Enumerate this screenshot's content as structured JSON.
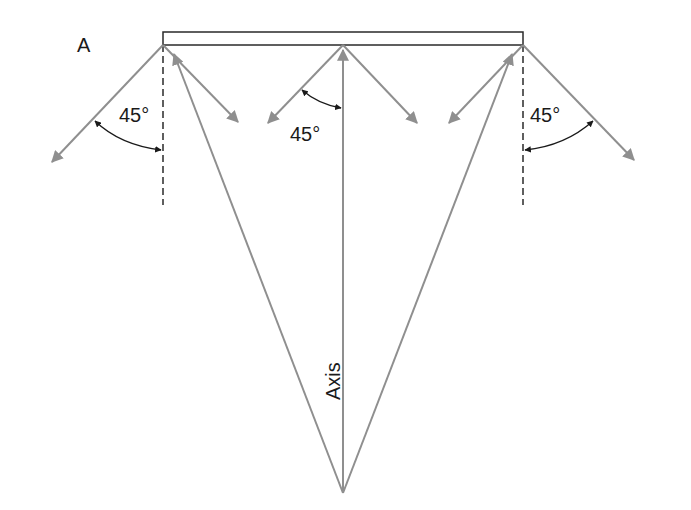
{
  "diagram": {
    "corner_label": "A",
    "axis_label": "Axis",
    "angle_labels": [
      "45°",
      "45°",
      "45°"
    ],
    "colors": {
      "rays": "#8f8f8f",
      "lines": "#1a1a1a",
      "background": "#ffffff"
    }
  }
}
